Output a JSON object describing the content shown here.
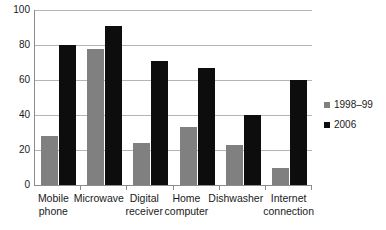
{
  "chart_data": {
    "type": "bar",
    "title": "",
    "subtitle": "",
    "xlabel": "",
    "ylabel": "",
    "ylim": [
      0,
      100
    ],
    "ytick_values": [
      100,
      80,
      60,
      40,
      20,
      0
    ],
    "ytick_labels": [
      "100",
      "80",
      "60",
      "40",
      "20",
      "0"
    ],
    "grid": true,
    "legend_position": "right",
    "categories": [
      "Mobile phone",
      "Microwave",
      "Digital receiver",
      "Home computer",
      "Dishwasher",
      "Internet connection"
    ],
    "category_lines": [
      [
        "Mobile",
        "phone"
      ],
      [
        "Microwave",
        ""
      ],
      [
        "Digital",
        "receiver"
      ],
      [
        "Home",
        "computer"
      ],
      [
        "Dishwasher",
        ""
      ],
      [
        "Internet",
        "connection"
      ]
    ],
    "series": [
      {
        "name": "1998–99",
        "color": "#808080",
        "values": [
          28,
          78,
          24,
          33,
          23,
          10
        ]
      },
      {
        "name": "2006",
        "color": "#0d0d0d",
        "values": [
          80,
          91,
          71,
          67,
          40,
          60
        ]
      }
    ]
  },
  "legend": {
    "items": [
      {
        "label": "1998–99",
        "color": "#808080"
      },
      {
        "label": "2006",
        "color": "#0d0d0d"
      }
    ]
  },
  "colors": {
    "series_1998_99": "#808080",
    "series_2006": "#0d0d0d",
    "gridline": "#b4b4b4",
    "axis": "#8c8c8c",
    "text": "#1a1a1a",
    "background": "#ffffff"
  }
}
